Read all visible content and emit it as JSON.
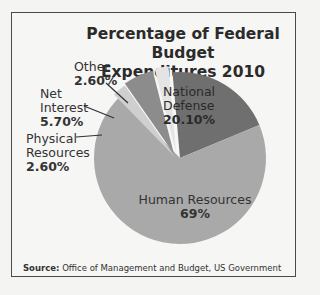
{
  "chart_data": {
    "type": "pie",
    "title": "Percentage of Federal Budget Expenditures 2010",
    "categories": [
      "National Defense",
      "Human Resources",
      "Physical Resources",
      "Net Interest",
      "Other"
    ],
    "values": [
      20.1,
      69,
      2.6,
      5.7,
      2.6
    ],
    "value_labels": [
      "20.10%",
      "69%",
      "2.60%",
      "5.70%",
      "2.60%"
    ],
    "colors": [
      "#6f6f6f",
      "#a9a9a9",
      "#cfcfcf",
      "#8c8c8c",
      "#e4e4e4"
    ],
    "legend": "none (direct labels)",
    "source_label": "Source:",
    "source": "Office of Management and Budget, US Government"
  },
  "labels": {
    "title_line1": "Percentage of Federal Budget",
    "title_line2": "Expenditures 2010",
    "national_defense_1": "National",
    "national_defense_2": "Defense",
    "national_defense_pct": "20.10%",
    "human_resources": "Human Resources",
    "human_resources_pct": "69%",
    "physical_resources_1": "Physical",
    "physical_resources_2": "Resources",
    "physical_resources_pct": "2.60%",
    "net_interest_1": "Net",
    "net_interest_2": "Interest",
    "net_interest_pct": "5.70%",
    "other": "Other",
    "other_pct": "2.60%"
  }
}
